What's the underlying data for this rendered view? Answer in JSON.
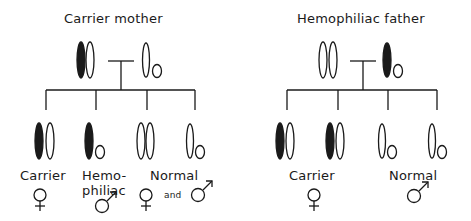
{
  "panels": [
    {
      "title": "Carrier mother",
      "parents": {
        "mother": {
          "chromosomes": [
            "X-affected",
            "X"
          ]
        },
        "father": {
          "chromosomes": [
            "X",
            "Y"
          ]
        }
      },
      "children": [
        {
          "chromosomes": [
            "X-affected",
            "X"
          ]
        },
        {
          "chromosomes": [
            "X-affected",
            "Y"
          ]
        },
        {
          "chromosomes": [
            "X",
            "X"
          ]
        },
        {
          "chromosomes": [
            "X",
            "Y"
          ]
        }
      ],
      "labels": {
        "carrier": "Carrier",
        "hemophiliac_line1": "Hemo-",
        "hemophiliac_line2": "philiac",
        "normal": "Normal",
        "and": "and"
      },
      "symbols": {
        "carrier": "female-symbol",
        "hemophiliac": "male-symbol",
        "normal_female": "female-symbol",
        "normal_male": "male-symbol"
      }
    },
    {
      "title": "Hemophiliac father",
      "parents": {
        "mother": {
          "chromosomes": [
            "X",
            "X"
          ]
        },
        "father": {
          "chromosomes": [
            "X-affected",
            "Y"
          ]
        }
      },
      "children": [
        {
          "chromosomes": [
            "X-affected",
            "X"
          ]
        },
        {
          "chromosomes": [
            "X-affected",
            "X"
          ]
        },
        {
          "chromosomes": [
            "X",
            "Y"
          ]
        },
        {
          "chromosomes": [
            "X",
            "Y"
          ]
        }
      ],
      "labels": {
        "carrier": "Carrier",
        "normal": "Normal"
      },
      "symbols": {
        "carrier": "female-symbol",
        "normal": "male-symbol"
      }
    }
  ],
  "colors": {
    "ink": "#1a1a1a",
    "background": "#ffffff"
  }
}
